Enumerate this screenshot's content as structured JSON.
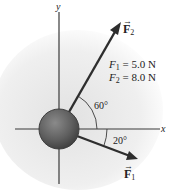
{
  "diagram": {
    "axes": {
      "x_label": "x",
      "y_label": "y"
    },
    "object": "sphere",
    "forces": [
      {
        "name": "F1",
        "symbol": "F",
        "subscript": "1",
        "magnitude": "5.0 N",
        "angle_deg": -20,
        "angle_label": "20°"
      },
      {
        "name": "F2",
        "symbol": "F",
        "subscript": "2",
        "magnitude": "8.0 N",
        "angle_deg": 60,
        "angle_label": "60°"
      }
    ],
    "given": [
      {
        "var": "F",
        "sub": "1",
        "eq": "=",
        "value": "5.0 N"
      },
      {
        "var": "F",
        "sub": "2",
        "eq": "=",
        "value": "8.0 N"
      }
    ],
    "colors": {
      "axis": "#3a3a3a",
      "arrow": "#2e2e2e",
      "sphere_fill": "#6e6e6e",
      "sphere_edge": "#3f3f3f",
      "background_glow": "#e6e6e6"
    }
  }
}
